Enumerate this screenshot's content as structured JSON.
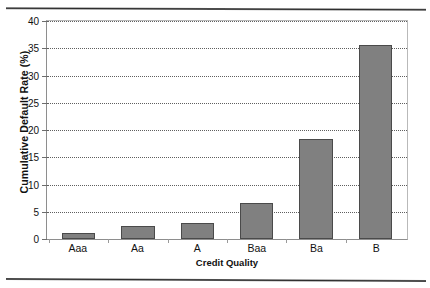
{
  "chart_data": {
    "type": "bar",
    "title": "",
    "categories": [
      "Aaa",
      "Aa",
      "A",
      "Baa",
      "Ba",
      "B"
    ],
    "values": [
      1.1,
      2.3,
      2.9,
      6.7,
      18.4,
      35.6
    ],
    "xlabel": "Credit Quality",
    "ylabel": "Cumulative Default Rate (%)",
    "ylim": [
      0,
      40
    ],
    "ytick_labels": [
      "0",
      "5",
      "10",
      "15",
      "20",
      "25",
      "30",
      "35",
      "40"
    ],
    "ytick_values": [
      0,
      5,
      10,
      15,
      20,
      25,
      30,
      35,
      40
    ],
    "grid": "horizontal-dotted",
    "legend": "none",
    "bar_color": "#808080",
    "bar_border_color": "#4a4a4a",
    "gridline_color": "#5f5f5f",
    "axis_color": "#8e8e8e"
  }
}
